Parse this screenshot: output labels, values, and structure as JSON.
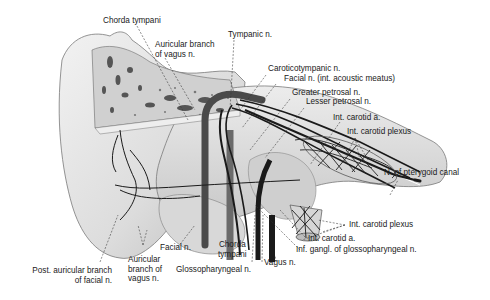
{
  "figure": {
    "colors": {
      "background": "#ffffff",
      "bone": "#e4e4e4",
      "bone_shadow": "#9a9a9a",
      "nerve": "#1a1a1a",
      "vessel": "#555555",
      "label_text": "#1a1a1a"
    }
  },
  "labels": {
    "chorda_tympani_top": "Chorda tympani",
    "auricular_branch_top_1": "Auricular branch",
    "auricular_branch_top_2": "of vagus n.",
    "tympanic_n": "Tympanic n.",
    "caroticotympanic_n": "Caroticotympanic n.",
    "facial_n_meatus": "Facial n. (int. acoustic meatus)",
    "greater_petrosal_n": "Greater petrosal n.",
    "lesser_petrosal_n": "Lesser petrosal n.",
    "int_carotid_a_top": "Int. carotid a.",
    "int_carotid_plexus_top": "Int. carotid plexus",
    "n_pterygoid_canal": "N. of pterygoid canal",
    "int_carotid_plexus_bottom": "Int. carotid plexus",
    "int_carotid_a_bottom": "Int. carotid a.",
    "inf_gangl_glossopharyngeal": "Inf. gangl. of glossopharyngeal n.",
    "vagus_n": "Vagus n.",
    "chorda_tympani_bottom_1": "Chorda",
    "chorda_tympani_bottom_2": "tympani",
    "glossopharyngeal_n": "Glossopharyngeal n.",
    "facial_n": "Facial n.",
    "auricular_branch_bottom_1": "Auricular",
    "auricular_branch_bottom_2": "branch of",
    "auricular_branch_bottom_3": "vagus n.",
    "post_auricular_1": "Post. auricular branch",
    "post_auricular_2": "of facial n."
  }
}
